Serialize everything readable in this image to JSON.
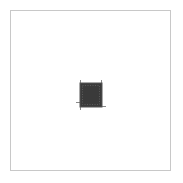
{
  "canvas": {
    "background": "#ffffff",
    "frame_border_color": "#c8c8c8"
  },
  "icon": {
    "semantic": "chip-icon",
    "fill_color": "#3a3a3a",
    "border_color": "#555555",
    "pin_color": "#8a8a8a"
  }
}
